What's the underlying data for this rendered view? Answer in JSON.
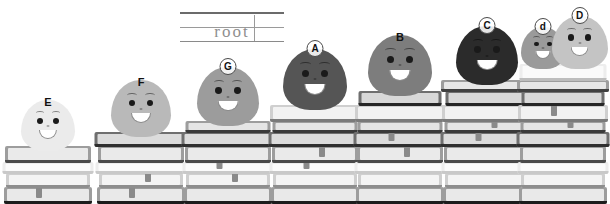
{
  "scene": {
    "title": "Root words blob characters on book stacks",
    "background_color": "#ffffff"
  },
  "writing_card": {
    "word": "root",
    "name": "root-handwriting-card",
    "rules": [
      "top-rule",
      "mid-dashed-rule",
      "bottom-rule"
    ]
  },
  "characters": [
    {
      "id": "E",
      "label": "E",
      "circled": false,
      "color": "#ebebeb",
      "size": 54,
      "books": 4,
      "stack_height": 52
    },
    {
      "id": "F",
      "label": "F",
      "circled": false,
      "color": "#b9b9b9",
      "size": 60,
      "books": 5,
      "stack_height": 74
    },
    {
      "id": "G",
      "label": "G",
      "circled": true,
      "color": "#9c9c9c",
      "size": 62,
      "books": 6,
      "stack_height": 92
    },
    {
      "id": "A",
      "label": "A",
      "circled": true,
      "color": "#555555",
      "size": 64,
      "books": 7,
      "stack_height": 110
    },
    {
      "id": "B",
      "label": "B",
      "circled": false,
      "color": "#7d7d7d",
      "size": 64,
      "books": 8,
      "stack_height": 126
    },
    {
      "id": "C",
      "label": "C",
      "circled": true,
      "color": "#2b2b2b",
      "size": 62,
      "books": 9,
      "stack_height": 142
    },
    {
      "id": "d",
      "label": "d",
      "circled": true,
      "color": "#9a9a9a",
      "size": 44,
      "books": 10,
      "stack_height": 160
    },
    {
      "id": "D",
      "label": "D",
      "circled": true,
      "color": "#c4c4c4",
      "size": 56,
      "books": 10,
      "stack_height": 160
    }
  ],
  "colors": {
    "book_dark": "#6f6f6f",
    "book_mid": "#9d9d9d",
    "book_light": "#cfcfcf",
    "book_pale": "#ededed",
    "book_base_dark": "#1c1c1c",
    "bookmark": "#8a8a8a",
    "outline": "#4a4a4a",
    "text": "#111111"
  }
}
